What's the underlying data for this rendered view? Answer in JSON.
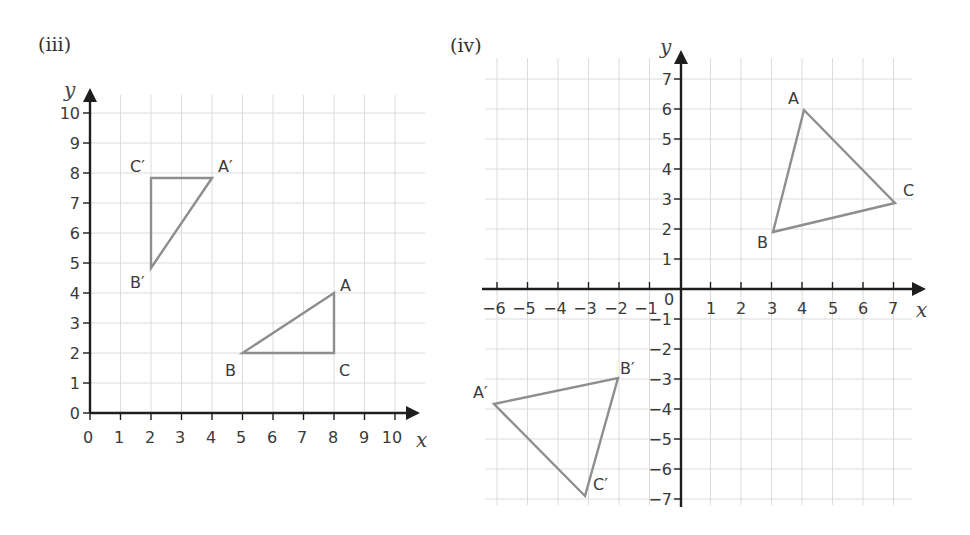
{
  "panels": [
    {
      "label": "(iii)",
      "x_axis_label": "x",
      "y_axis_label": "y",
      "x_ticks": [
        "0",
        "1",
        "2",
        "3",
        "4",
        "5",
        "6",
        "7",
        "8",
        "9",
        "10"
      ],
      "y_ticks": [
        "0",
        "1",
        "2",
        "3",
        "4",
        "5",
        "6",
        "7",
        "8",
        "9",
        "10"
      ],
      "triangles": [
        {
          "name": "ABC",
          "vertices": [
            {
              "label": "A",
              "x": 8,
              "y": 4
            },
            {
              "label": "B",
              "x": 5,
              "y": 2
            },
            {
              "label": "C",
              "x": 8,
              "y": 2
            }
          ]
        },
        {
          "name": "A'B'C'",
          "vertices": [
            {
              "label": "A′",
              "x": 4,
              "y": 8
            },
            {
              "label": "B′",
              "x": 2,
              "y": 5
            },
            {
              "label": "C′",
              "x": 2,
              "y": 8
            }
          ]
        }
      ]
    },
    {
      "label": "(iv)",
      "x_axis_label": "x",
      "y_axis_label": "y",
      "origin_label": "0",
      "x_ticks": [
        "−6",
        "−5",
        "−4",
        "−3",
        "−2",
        "−1",
        "1",
        "2",
        "3",
        "4",
        "5",
        "6",
        "7"
      ],
      "y_ticks": [
        "7",
        "6",
        "5",
        "4",
        "3",
        "2",
        "1",
        "−1",
        "−2",
        "−3",
        "−4",
        "−5",
        "−6",
        "−7"
      ],
      "triangles": [
        {
          "name": "ABC",
          "vertices": [
            {
              "label": "A",
              "x": 4,
              "y": 6
            },
            {
              "label": "B",
              "x": 3,
              "y": 2
            },
            {
              "label": "C",
              "x": 7,
              "y": 3
            }
          ]
        },
        {
          "name": "A'B'C'",
          "vertices": [
            {
              "label": "A′",
              "x": -6,
              "y": -4
            },
            {
              "label": "B′",
              "x": -2,
              "y": -3
            },
            {
              "label": "C′",
              "x": -3,
              "y": -7
            }
          ]
        }
      ]
    }
  ]
}
